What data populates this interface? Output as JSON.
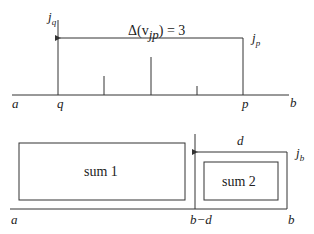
{
  "top_diagram": {
    "labels": {
      "a": "a",
      "q": "q",
      "p": "p",
      "b": "b",
      "j_q_base": "j",
      "j_q_sub": "q",
      "j_p_base": "j",
      "j_p_sub": "p",
      "delta_equation": "Δ(v",
      "delta_sub": "jp",
      "delta_rhs": ") = 3"
    }
  },
  "bottom_diagram": {
    "labels": {
      "a": "a",
      "b_minus_d": "b−d",
      "b": "b",
      "d": "d",
      "j_b_base": "j",
      "j_b_sub": "b",
      "sum1": "sum 1",
      "sum2": "sum 2"
    }
  },
  "colors": {
    "stroke": "#333333",
    "text": "#222222"
  }
}
